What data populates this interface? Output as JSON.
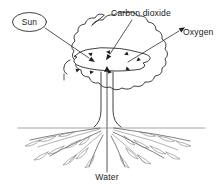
{
  "diagram": {
    "type": "line-drawing",
    "background_color": "#ffffff",
    "line_color": "#2b2b2b",
    "text_color": "#1a1a1a"
  },
  "labels": {
    "sun": "Sun",
    "carbon_dioxide": "Carbon dioxide",
    "oxygen": "Oxygen",
    "water": "Water"
  },
  "parts": {
    "canopy": "tree-canopy",
    "leaf": "leaf",
    "trunk": "tree-trunk",
    "roots": "tree-roots",
    "ground": "ground-line",
    "water_stem": "water-transport-stem"
  },
  "arrows": {
    "sun_to_leaf": "sunlight-arrow",
    "co2_to_leaf": "carbon-dioxide-arrow",
    "leaf_to_oxygen": "oxygen-arrow",
    "water_up": "water-uptake-arrow"
  }
}
